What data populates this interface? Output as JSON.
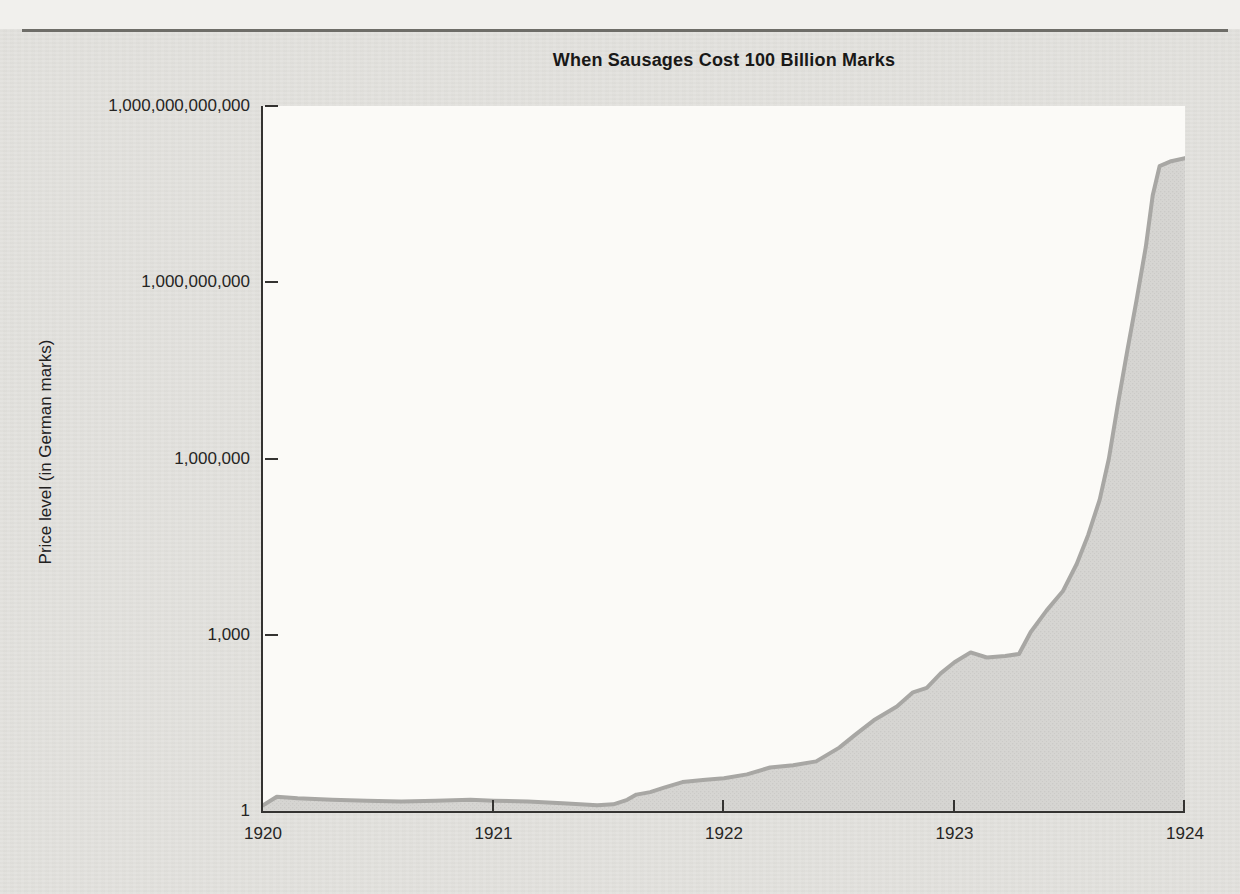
{
  "figure": {
    "title": "When Sausages Cost 100 Billion Marks"
  },
  "chart_data": {
    "type": "area",
    "title": "When Sausages Cost 100 Billion Marks",
    "xlabel": "",
    "ylabel": "Price level (in German marks)",
    "y_scale": "log",
    "grid": false,
    "legend": "none",
    "xlim": [
      1920,
      1924
    ],
    "ylim": [
      1,
      1000000000000
    ],
    "x_ticks": [
      {
        "value": 1920,
        "label": "1920"
      },
      {
        "value": 1921,
        "label": "1921"
      },
      {
        "value": 1922,
        "label": "1922"
      },
      {
        "value": 1923,
        "label": "1923"
      },
      {
        "value": 1924,
        "label": "1924"
      }
    ],
    "y_ticks": [
      {
        "value": 1,
        "label": "1"
      },
      {
        "value": 1000,
        "label": "1,000"
      },
      {
        "value": 1000000,
        "label": "1,000,000"
      },
      {
        "value": 1000000000,
        "label": "1,000,000,000"
      },
      {
        "value": 1000000000000,
        "label": "1,000,000,000,000"
      }
    ],
    "series": [
      {
        "name": "Price level (in German marks)",
        "points": [
          [
            1920.0,
            1.25
          ],
          [
            1920.06,
            1.75
          ],
          [
            1920.15,
            1.65
          ],
          [
            1920.3,
            1.55
          ],
          [
            1920.45,
            1.5
          ],
          [
            1920.6,
            1.45
          ],
          [
            1920.75,
            1.5
          ],
          [
            1920.9,
            1.55
          ],
          [
            1921.0,
            1.5
          ],
          [
            1921.15,
            1.45
          ],
          [
            1921.3,
            1.35
          ],
          [
            1921.45,
            1.25
          ],
          [
            1921.52,
            1.3
          ],
          [
            1921.58,
            1.55
          ],
          [
            1921.62,
            1.9
          ],
          [
            1921.68,
            2.1
          ],
          [
            1921.74,
            2.5
          ],
          [
            1921.82,
            3.1
          ],
          [
            1921.92,
            3.4
          ],
          [
            1922.0,
            3.6
          ],
          [
            1922.1,
            4.2
          ],
          [
            1922.2,
            5.5
          ],
          [
            1922.3,
            6.0
          ],
          [
            1922.4,
            7.0
          ],
          [
            1922.5,
            12
          ],
          [
            1922.57,
            20
          ],
          [
            1922.65,
            35
          ],
          [
            1922.75,
            60
          ],
          [
            1922.82,
            105
          ],
          [
            1922.88,
            125
          ],
          [
            1922.94,
            220
          ],
          [
            1923.0,
            340
          ],
          [
            1923.07,
            500
          ],
          [
            1923.14,
            410
          ],
          [
            1923.22,
            435
          ],
          [
            1923.28,
            470
          ],
          [
            1923.33,
            1100
          ],
          [
            1923.4,
            2600
          ],
          [
            1923.47,
            5500
          ],
          [
            1923.53,
            16000
          ],
          [
            1923.58,
            50000
          ],
          [
            1923.63,
            200000
          ],
          [
            1923.67,
            1000000
          ],
          [
            1923.71,
            9000000
          ],
          [
            1923.75,
            70000000
          ],
          [
            1923.79,
            500000000
          ],
          [
            1923.83,
            4000000000
          ],
          [
            1923.86,
            30000000000
          ],
          [
            1923.89,
            95000000000
          ],
          [
            1923.94,
            115000000000
          ],
          [
            1924.0,
            130000000000
          ]
        ]
      }
    ],
    "colors": {
      "area_fill": "#d6d5d2",
      "area_fill_dot": "#cbcac7",
      "area_stroke": "#a8a7a4",
      "axis": "#343331",
      "plot_background": "#fbfaf7",
      "page_background": "#e2e1dd",
      "ink": "#191817"
    }
  }
}
